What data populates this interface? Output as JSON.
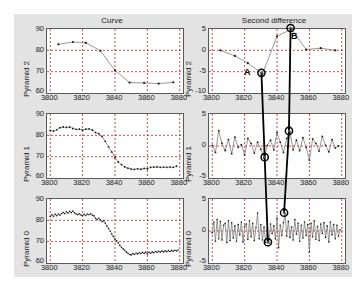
{
  "figure": {
    "column_titles": [
      "Curve",
      "Second difference"
    ],
    "row_labels": [
      "Pyramid 2",
      "Pyramid 1",
      "Pyramid 0"
    ],
    "annotations": [
      {
        "label": "A",
        "x": 3831,
        "y": -5.5
      },
      {
        "label": "B",
        "x": 3849,
        "y": 5.0
      }
    ],
    "caption": ""
  },
  "axes": {
    "xticks": [
      "3800",
      "3820",
      "3840",
      "3860",
      "3880"
    ],
    "xlim": [
      3798,
      3882
    ],
    "curve_yticks": [
      "90",
      "80",
      "70",
      "60"
    ],
    "curve_ylim": [
      60,
      90
    ],
    "diff2_yticks": [
      "5",
      "0",
      "-5",
      "-10"
    ],
    "diff2_ylim": [
      -10,
      5
    ],
    "diff1_yticks": [
      "5",
      "0",
      "-5"
    ],
    "diff1_ylim": [
      -5,
      5
    ],
    "diff0_yticks": [
      "5",
      "0",
      "-5"
    ],
    "diff0_ylim": [
      -5,
      5
    ]
  },
  "chart_data": {
    "type": "line",
    "xlabel": "",
    "ylabel": "",
    "grid": true,
    "legend": "none",
    "panels": [
      {
        "name": "curve-pyramid-2",
        "row": "Pyramid 2",
        "column": "Curve",
        "ylim": [
          60,
          90
        ],
        "x": [
          3805,
          3814,
          3822,
          3831,
          3840,
          3849,
          3858,
          3867,
          3876
        ],
        "values": [
          82.8,
          83.9,
          83.5,
          79.8,
          70.6,
          64.9,
          64.7,
          64.4,
          65.0
        ]
      },
      {
        "name": "second-difference-pyramid-2",
        "row": "Pyramid 2",
        "column": "Second difference",
        "ylim": [
          -10,
          5
        ],
        "x": [
          3805,
          3814,
          3822,
          3831,
          3840,
          3849,
          3858,
          3867,
          3876
        ],
        "values": [
          0.0,
          -1.3,
          -3.0,
          -5.5,
          3.3,
          5.0,
          0.2,
          0.5,
          0.0
        ]
      },
      {
        "name": "curve-pyramid-1",
        "row": "Pyramid 1",
        "column": "Curve",
        "ylim": [
          60,
          90
        ],
        "x": [
          3800,
          3802,
          3804,
          3806,
          3808,
          3810,
          3812,
          3814,
          3816,
          3818,
          3820,
          3822,
          3824,
          3826,
          3828,
          3830,
          3832,
          3834,
          3836,
          3838,
          3840,
          3842,
          3844,
          3846,
          3848,
          3850,
          3852,
          3854,
          3856,
          3858,
          3860,
          3862,
          3864,
          3866,
          3868,
          3870,
          3872,
          3874,
          3876,
          3878
        ],
        "values": [
          82.3,
          82.0,
          82.6,
          83.6,
          83.9,
          83.7,
          83.9,
          83.2,
          82.8,
          82.9,
          82.4,
          82.9,
          83.0,
          82.5,
          81.3,
          80.8,
          79.5,
          77.2,
          74.6,
          72.2,
          69.6,
          67.5,
          66.3,
          65.2,
          64.6,
          64.2,
          64.0,
          64.3,
          64.1,
          64.5,
          64.3,
          65.0,
          65.1,
          65.2,
          65.0,
          65.1,
          65.0,
          65.1,
          65.0,
          65.5
        ]
      },
      {
        "name": "second-difference-pyramid-1",
        "row": "Pyramid 1",
        "column": "Second difference",
        "ylim": [
          -5,
          5
        ],
        "x": [
          3800,
          3802,
          3804,
          3806,
          3808,
          3810,
          3812,
          3814,
          3816,
          3818,
          3820,
          3822,
          3824,
          3826,
          3828,
          3830,
          3832,
          3834,
          3836,
          3838,
          3840,
          3842,
          3844,
          3846,
          3848,
          3850,
          3852,
          3854,
          3856,
          3858,
          3860,
          3862,
          3864,
          3866,
          3868,
          3870,
          3872,
          3874,
          3876,
          3878
        ],
        "values": [
          0.1,
          -1.0,
          2.4,
          0.4,
          -0.7,
          1.0,
          -1.2,
          1.4,
          -0.2,
          0.2,
          -1.4,
          1.2,
          0.4,
          -1.1,
          0.6,
          -0.5,
          -1.9,
          0.1,
          0.9,
          -0.6,
          2.1,
          0.6,
          -1.0,
          1.2,
          2.2,
          -0.6,
          0.9,
          -0.7,
          1.3,
          -0.2,
          -2.2,
          1.1,
          0.4,
          -0.8,
          1.5,
          0.1,
          -0.9,
          1.0,
          -0.3,
          0.0
        ]
      },
      {
        "name": "curve-pyramid-0",
        "row": "Pyramid 0",
        "column": "Curve",
        "ylim": [
          60,
          90
        ],
        "x": [
          3800,
          3801,
          3802,
          3803,
          3804,
          3805,
          3806,
          3807,
          3808,
          3809,
          3810,
          3811,
          3812,
          3813,
          3814,
          3815,
          3816,
          3817,
          3818,
          3819,
          3820,
          3821,
          3822,
          3823,
          3824,
          3825,
          3826,
          3827,
          3828,
          3829,
          3830,
          3831,
          3832,
          3833,
          3834,
          3835,
          3836,
          3837,
          3838,
          3839,
          3840,
          3841,
          3842,
          3843,
          3844,
          3845,
          3846,
          3847,
          3848,
          3849,
          3850,
          3851,
          3852,
          3853,
          3854,
          3855,
          3856,
          3857,
          3858,
          3859,
          3860,
          3861,
          3862,
          3863,
          3864,
          3865,
          3866,
          3867,
          3868,
          3869,
          3870,
          3871,
          3872,
          3873,
          3874,
          3875,
          3876,
          3877,
          3878,
          3879
        ],
        "values": [
          81.8,
          82.6,
          81.9,
          82.8,
          82.2,
          83.0,
          82.4,
          83.2,
          83.7,
          83.1,
          84.0,
          83.4,
          84.2,
          83.6,
          84.3,
          83.5,
          83.0,
          82.6,
          83.1,
          82.5,
          82.2,
          82.8,
          82.3,
          83.0,
          82.6,
          83.1,
          82.4,
          82.1,
          81.0,
          80.4,
          81.0,
          80.2,
          79.4,
          79.8,
          78.6,
          77.4,
          76.2,
          75.0,
          73.6,
          72.4,
          71.2,
          70.4,
          69.4,
          68.2,
          67.4,
          66.6,
          66.0,
          65.2,
          64.6,
          64.0,
          63.8,
          64.4,
          64.0,
          64.6,
          64.2,
          64.8,
          64.4,
          65.0,
          64.5,
          65.1,
          64.2,
          65.0,
          64.6,
          65.2,
          64.8,
          65.4,
          65.0,
          65.5,
          65.1,
          65.6,
          65.2,
          65.7,
          65.3,
          65.8,
          65.4,
          65.9,
          65.5,
          66.0,
          65.6,
          66.1
        ]
      },
      {
        "name": "second-difference-pyramid-0",
        "row": "Pyramid 0",
        "column": "Second difference",
        "ylim": [
          -5,
          5
        ],
        "x": [
          3800,
          3801,
          3802,
          3803,
          3804,
          3805,
          3806,
          3807,
          3808,
          3809,
          3810,
          3811,
          3812,
          3813,
          3814,
          3815,
          3816,
          3817,
          3818,
          3819,
          3820,
          3821,
          3822,
          3823,
          3824,
          3825,
          3826,
          3827,
          3828,
          3829,
          3830,
          3831,
          3832,
          3833,
          3834,
          3835,
          3836,
          3837,
          3838,
          3839,
          3840,
          3841,
          3842,
          3843,
          3844,
          3845,
          3846,
          3847,
          3848,
          3849,
          3850,
          3851,
          3852,
          3853,
          3854,
          3855,
          3856,
          3857,
          3858,
          3859,
          3860,
          3861,
          3862,
          3863,
          3864,
          3865,
          3866,
          3867,
          3868,
          3869,
          3870,
          3871,
          3872,
          3873,
          3874,
          3875,
          3876,
          3877,
          3878,
          3879
        ],
        "values": [
          -0.3,
          1.4,
          -1.6,
          1.8,
          -1.2,
          1.5,
          -1.4,
          0.9,
          1.2,
          -1.8,
          1.6,
          -1.5,
          1.3,
          -1.1,
          0.8,
          -1.6,
          1.0,
          -0.6,
          1.4,
          -1.7,
          0.7,
          1.1,
          -1.3,
          1.6,
          -0.9,
          1.2,
          -1.5,
          0.5,
          2.8,
          -1.2,
          1.0,
          -1.4,
          0.6,
          -1.8,
          0.3,
          -1.9,
          1.1,
          -0.4,
          0.8,
          -1.2,
          2.0,
          -2.6,
          0.9,
          -0.7,
          1.3,
          2.7,
          -0.8,
          1.5,
          -1.0,
          0.6,
          -1.4,
          1.8,
          -0.5,
          1.2,
          -1.6,
          0.9,
          -1.1,
          1.4,
          -0.7,
          1.0,
          -3.3,
          1.2,
          -0.9,
          1.6,
          -1.3,
          0.7,
          -1.5,
          1.1,
          -0.4,
          1.3,
          -1.0,
          0.8,
          -1.7,
          1.4,
          -0.6,
          1.0,
          -1.2,
          0.9,
          -0.8,
          0.2
        ]
      }
    ]
  }
}
